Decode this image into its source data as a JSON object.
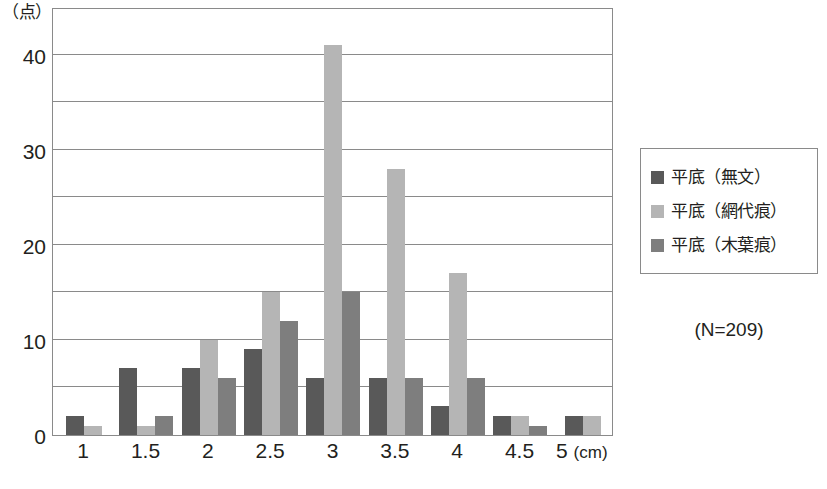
{
  "chart_data": {
    "type": "bar",
    "title": "",
    "subtitle": "",
    "xlabel": "",
    "ylabel": "（点）",
    "x_unit": "(cm)",
    "categories": [
      "1",
      "1.5",
      "2",
      "2.5",
      "3",
      "3.5",
      "4",
      "4.5",
      "5"
    ],
    "series": [
      {
        "name": "平底（無文）",
        "color": "#595959",
        "values": [
          2,
          7,
          7,
          9,
          6,
          6,
          3,
          2,
          2
        ]
      },
      {
        "name": "平底（網代痕）",
        "color": "#b5b5b5",
        "values": [
          1,
          1,
          10,
          15,
          41,
          28,
          17,
          2,
          2
        ]
      },
      {
        "name": "平底（木葉痕）",
        "color": "#7e7e7e",
        "values": [
          0,
          2,
          6,
          12,
          15,
          6,
          6,
          1,
          0
        ]
      }
    ],
    "ylim": [
      0,
      45
    ],
    "y_ticks_labeled": [
      "0",
      "10",
      "20",
      "30",
      "40"
    ],
    "y_tick_values_labeled": [
      0,
      10,
      20,
      30,
      40
    ],
    "y_gridline_values": [
      5,
      10,
      15,
      20,
      25,
      30,
      35,
      40
    ],
    "grid": true,
    "legend_position": "right",
    "annotation": "(N=209)"
  },
  "axes": {
    "y_unit_label": "（点）",
    "x_unit_label": "(cm)"
  },
  "legend": {
    "items": [
      {
        "label": "平底（無文）",
        "color": "#595959"
      },
      {
        "label": "平底（網代痕）",
        "color": "#b5b5b5"
      },
      {
        "label": "平底（木葉痕）",
        "color": "#7e7e7e"
      }
    ]
  },
  "annotations": {
    "sample_size": "(N=209)"
  },
  "caption": {
    "text": ""
  }
}
